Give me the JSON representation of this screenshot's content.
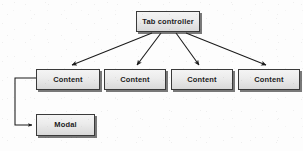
{
  "diagram": {
    "type": "flowchart",
    "background_color": "#fdfdfd",
    "node_fill_top": "#f4f4f4",
    "node_fill_bottom": "#d9d9d9",
    "node_border_color": "#3a3a3a",
    "shadow_color": "#282828",
    "edge_color": "#1a1a1a",
    "nodes": [
      {
        "id": "tab",
        "label": "Tab controller",
        "x": 136,
        "y": 11,
        "w": 64,
        "h": 21
      },
      {
        "id": "c0",
        "label": "Content",
        "x": 36,
        "y": 69,
        "w": 64,
        "h": 21
      },
      {
        "id": "c1",
        "label": "Content",
        "x": 104,
        "y": 69,
        "w": 62,
        "h": 21
      },
      {
        "id": "c2",
        "label": "Content",
        "x": 171,
        "y": 69,
        "w": 62,
        "h": 21
      },
      {
        "id": "c3",
        "label": "Content",
        "x": 238,
        "y": 69,
        "w": 62,
        "h": 21
      },
      {
        "id": "modal",
        "label": "Modal",
        "x": 36,
        "y": 114,
        "w": 59,
        "h": 22
      }
    ],
    "edges": [
      {
        "id": "tab-c0",
        "from": "tab",
        "to": "c0",
        "style": "straight-arrow"
      },
      {
        "id": "tab-c1",
        "from": "tab",
        "to": "c1",
        "style": "straight-arrow"
      },
      {
        "id": "tab-c2",
        "from": "tab",
        "to": "c2",
        "style": "straight-arrow"
      },
      {
        "id": "tab-c3",
        "from": "tab",
        "to": "c3",
        "style": "straight-arrow"
      },
      {
        "id": "c0-modal",
        "from": "c0",
        "to": "modal",
        "style": "elbow-arrow"
      }
    ]
  }
}
